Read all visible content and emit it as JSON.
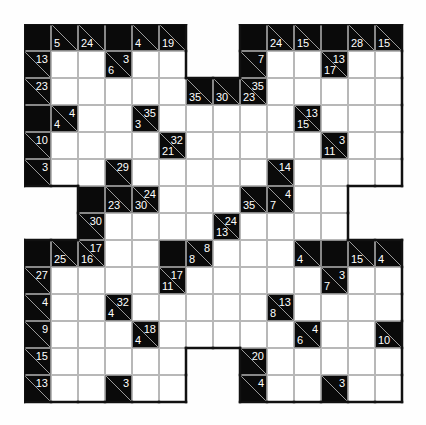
{
  "puzzle": {
    "type": "kakuro",
    "rows": 14,
    "cols": 14,
    "legend": {
      "o": "outside",
      "b": "black",
      "w": "white entry cell"
    },
    "grid": [
      [
        "b",
        {
          "d": 5
        },
        {
          "d": 24
        },
        "b",
        {
          "d": 4
        },
        {
          "d": 19
        },
        "o",
        "o",
        "b",
        {
          "d": 24
        },
        {
          "d": 15
        },
        "b",
        {
          "d": 28
        },
        {
          "d": 15
        }
      ],
      [
        {
          "a": 13
        },
        "w",
        "w",
        {
          "a": 3,
          "d": 6
        },
        "w",
        "w",
        "o",
        "o",
        {
          "a": 7
        },
        "w",
        "w",
        {
          "a": 13,
          "d": 17
        },
        "w",
        "w"
      ],
      [
        {
          "a": 23
        },
        "w",
        "w",
        "w",
        "w",
        "w",
        {
          "d": 35
        },
        {
          "d": 30
        },
        {
          "a": 35,
          "d": 23
        },
        "w",
        "w",
        "w",
        "w",
        "w"
      ],
      [
        "b",
        {
          "a": 4,
          "d": 4
        },
        "w",
        "w",
        {
          "a": 35,
          "d": 3
        },
        "w",
        "w",
        "w",
        "w",
        "w",
        {
          "a": 13,
          "d": 15
        },
        "w",
        "w",
        "w"
      ],
      [
        {
          "a": 10
        },
        "w",
        "w",
        "w",
        "w",
        {
          "a": 32,
          "d": 21
        },
        "w",
        "w",
        "w",
        "w",
        "w",
        {
          "a": 3,
          "d": 11
        },
        "w",
        "w"
      ],
      [
        {
          "a": 3
        },
        "w",
        "w",
        {
          "a": 29
        },
        "w",
        "w",
        "w",
        "w",
        "w",
        {
          "a": 14
        },
        "w",
        "w",
        "w",
        "w"
      ],
      [
        "o",
        "o",
        "b",
        {
          "d": 23
        },
        {
          "a": 24,
          "d": 30
        },
        "w",
        "w",
        "w",
        {
          "d": 35
        },
        {
          "a": 4,
          "d": 7
        },
        "w",
        "w",
        "o",
        "o"
      ],
      [
        "o",
        "o",
        {
          "a": 30
        },
        "w",
        "w",
        "w",
        "w",
        {
          "a": 24,
          "d": 13
        },
        "w",
        "w",
        "w",
        "w",
        "o",
        "o"
      ],
      [
        "b",
        {
          "d": 25
        },
        {
          "a": 17,
          "d": 16
        },
        "w",
        "w",
        "b",
        {
          "a": 8,
          "d": 8
        },
        "w",
        "w",
        "w",
        {
          "d": 4
        },
        "b",
        {
          "d": 15
        },
        {
          "d": 4
        }
      ],
      [
        {
          "a": 27
        },
        "w",
        "w",
        "w",
        "w",
        {
          "a": 17,
          "d": 11
        },
        "w",
        "w",
        "w",
        "w",
        "w",
        {
          "a": 3,
          "d": 7
        },
        "w",
        "w"
      ],
      [
        {
          "a": 4
        },
        "w",
        "w",
        {
          "a": 32,
          "d": 4
        },
        "w",
        "w",
        "w",
        "w",
        "w",
        {
          "a": 13,
          "d": 8
        },
        "w",
        "w",
        "w",
        "w"
      ],
      [
        {
          "a": 9
        },
        "w",
        "w",
        "w",
        {
          "a": 18,
          "d": 4
        },
        "w",
        "w",
        "w",
        "w",
        "w",
        {
          "a": 4,
          "d": 6
        },
        "w",
        "w",
        {
          "d": 10
        }
      ],
      [
        {
          "a": 15
        },
        "w",
        "w",
        "w",
        "w",
        "w",
        "o",
        "o",
        {
          "a": 20
        },
        "w",
        "w",
        "w",
        "w",
        "w"
      ],
      [
        {
          "a": 13
        },
        "w",
        "w",
        {
          "a": 3
        },
        "w",
        "w",
        "o",
        "o",
        {
          "a": 4
        },
        "w",
        "w",
        {
          "a": 3
        },
        "w",
        "w"
      ]
    ]
  }
}
